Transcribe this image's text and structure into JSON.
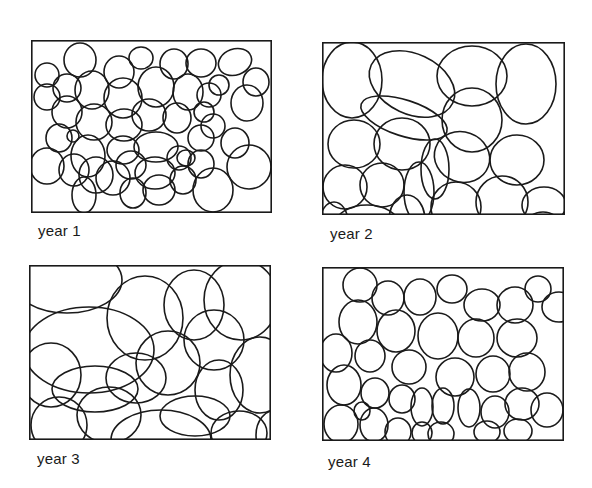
{
  "figure": {
    "stroke_color": "#1a1a1a",
    "background": "#ffffff",
    "panels": [
      {
        "label": "year 1",
        "box": {
          "x": 31,
          "y": 40,
          "w": 241,
          "h": 173
        },
        "label_pos": {
          "x": 38,
          "y": 222
        },
        "ellipses": [
          [
            16,
            35,
            12,
            12,
            0
          ],
          [
            49,
            20,
            16,
            17,
            0
          ],
          [
            88,
            32,
            15,
            16,
            0
          ],
          [
            110,
            18,
            12,
            11,
            0
          ],
          [
            143,
            24,
            14,
            15,
            0
          ],
          [
            170,
            23,
            15,
            14,
            0
          ],
          [
            204,
            22,
            17,
            13,
            -20
          ],
          [
            225,
            42,
            13,
            14,
            0
          ],
          [
            16,
            57,
            13,
            13,
            0
          ],
          [
            36,
            48,
            14,
            14,
            0
          ],
          [
            61,
            50,
            17,
            19,
            0
          ],
          [
            92,
            58,
            19,
            20,
            0
          ],
          [
            125,
            47,
            18,
            20,
            0
          ],
          [
            157,
            52,
            15,
            18,
            0
          ],
          [
            178,
            55,
            12,
            12,
            0
          ],
          [
            188,
            45,
            10,
            10,
            0
          ],
          [
            216,
            63,
            16,
            18,
            0
          ],
          [
            36,
            72,
            15,
            16,
            0
          ],
          [
            63,
            82,
            18,
            18,
            0
          ],
          [
            93,
            85,
            18,
            16,
            0
          ],
          [
            118,
            75,
            17,
            16,
            0
          ],
          [
            146,
            78,
            14,
            15,
            0
          ],
          [
            173,
            72,
            10,
            10,
            0
          ],
          [
            182,
            86,
            12,
            12,
            0
          ],
          [
            28,
            98,
            13,
            14,
            0
          ],
          [
            57,
            116,
            17,
            21,
            0
          ],
          [
            92,
            110,
            16,
            14,
            0
          ],
          [
            125,
            107,
            22,
            15,
            0
          ],
          [
            148,
            118,
            12,
            12,
            0
          ],
          [
            170,
            98,
            13,
            13,
            0
          ],
          [
            204,
            103,
            14,
            15,
            0
          ],
          [
            218,
            127,
            22,
            22,
            0
          ],
          [
            16,
            126,
            17,
            18,
            0
          ],
          [
            43,
            130,
            15,
            16,
            0
          ],
          [
            65,
            135,
            17,
            18,
            0
          ],
          [
            100,
            125,
            15,
            14,
            0
          ],
          [
            124,
            133,
            20,
            16,
            0
          ],
          [
            155,
            118,
            9,
            8,
            0
          ],
          [
            170,
            124,
            13,
            14,
            0
          ],
          [
            53,
            155,
            12,
            18,
            0
          ],
          [
            82,
            138,
            17,
            17,
            0
          ],
          [
            102,
            153,
            13,
            15,
            0
          ],
          [
            128,
            150,
            16,
            15,
            0
          ],
          [
            152,
            140,
            13,
            14,
            0
          ],
          [
            182,
            150,
            20,
            22,
            0
          ],
          [
            42,
            96,
            6,
            6,
            0
          ]
        ]
      },
      {
        "label": "year 2",
        "box": {
          "x": 322,
          "y": 42,
          "w": 243,
          "h": 173
        },
        "label_pos": {
          "x": 330,
          "y": 225
        },
        "ellipses": [
          [
            30,
            38,
            30,
            38,
            0
          ],
          [
            90,
            42,
            45,
            30,
            25
          ],
          [
            150,
            34,
            35,
            30,
            0
          ],
          [
            204,
            42,
            30,
            40,
            0
          ],
          [
            82,
            76,
            45,
            18,
            18
          ],
          [
            150,
            78,
            30,
            32,
            0
          ],
          [
            32,
            102,
            26,
            24,
            0
          ],
          [
            80,
            102,
            28,
            26,
            0
          ],
          [
            140,
            115,
            28,
            25,
            20
          ],
          [
            195,
            118,
            27,
            25,
            0
          ],
          [
            113,
            127,
            14,
            30,
            0
          ],
          [
            23,
            145,
            22,
            22,
            0
          ],
          [
            60,
            143,
            22,
            22,
            0
          ],
          [
            97,
            150,
            15,
            30,
            0
          ],
          [
            134,
            165,
            25,
            25,
            0
          ],
          [
            180,
            160,
            26,
            26,
            0
          ],
          [
            222,
            163,
            22,
            18,
            0
          ],
          [
            45,
            183,
            32,
            20,
            0
          ],
          [
            85,
            178,
            18,
            25,
            0
          ],
          [
            221,
            192,
            22,
            22,
            0
          ],
          [
            12,
            180,
            14,
            20,
            0
          ]
        ]
      },
      {
        "label": "year 3",
        "box": {
          "x": 29,
          "y": 265,
          "w": 242,
          "h": 175
        },
        "label_pos": {
          "x": 37,
          "y": 450
        },
        "ellipses": [
          [
            38,
            15,
            55,
            33,
            0
          ],
          [
            60,
            85,
            65,
            43,
            0
          ],
          [
            116,
            53,
            38,
            42,
            0
          ],
          [
            165,
            40,
            30,
            35,
            0
          ],
          [
            212,
            35,
            37,
            40,
            0
          ],
          [
            185,
            75,
            30,
            30,
            0
          ],
          [
            139,
            98,
            32,
            32,
            0
          ],
          [
            107,
            113,
            30,
            25,
            0
          ],
          [
            66,
            124,
            43,
            23,
            0
          ],
          [
            22,
            110,
            30,
            32,
            0
          ],
          [
            190,
            125,
            24,
            30,
            0
          ],
          [
            231,
            110,
            30,
            38,
            0
          ],
          [
            30,
            160,
            28,
            28,
            0
          ],
          [
            80,
            150,
            32,
            28,
            0
          ],
          [
            132,
            175,
            50,
            30,
            0
          ],
          [
            166,
            151,
            35,
            20,
            0
          ],
          [
            210,
            168,
            28,
            22,
            0
          ],
          [
            247,
            170,
            20,
            25,
            0
          ]
        ]
      },
      {
        "label": "year 4",
        "box": {
          "x": 322,
          "y": 267,
          "w": 242,
          "h": 174
        },
        "label_pos": {
          "x": 328,
          "y": 453
        },
        "ellipses": [
          [
            38,
            18,
            17,
            17,
            0
          ],
          [
            66,
            31,
            16,
            17,
            0
          ],
          [
            98,
            30,
            16,
            18,
            0
          ],
          [
            130,
            22,
            15,
            14,
            0
          ],
          [
            160,
            38,
            18,
            16,
            0
          ],
          [
            193,
            38,
            18,
            18,
            0
          ],
          [
            216,
            22,
            13,
            13,
            0
          ],
          [
            237,
            40,
            17,
            15,
            0
          ],
          [
            36,
            55,
            19,
            22,
            0
          ],
          [
            74,
            64,
            19,
            21,
            0
          ],
          [
            116,
            69,
            20,
            23,
            0
          ],
          [
            154,
            71,
            18,
            19,
            0
          ],
          [
            195,
            71,
            20,
            19,
            0
          ],
          [
            14,
            86,
            16,
            19,
            0
          ],
          [
            48,
            89,
            15,
            16,
            0
          ],
          [
            87,
            100,
            17,
            17,
            0
          ],
          [
            133,
            110,
            19,
            19,
            0
          ],
          [
            171,
            107,
            17,
            18,
            0
          ],
          [
            205,
            105,
            18,
            19,
            0
          ],
          [
            22,
            118,
            17,
            20,
            0
          ],
          [
            53,
            126,
            14,
            15,
            0
          ],
          [
            80,
            132,
            13,
            14,
            0
          ],
          [
            100,
            140,
            11,
            19,
            0
          ],
          [
            121,
            139,
            11,
            18,
            0
          ],
          [
            147,
            141,
            11,
            19,
            0
          ],
          [
            173,
            145,
            14,
            16,
            0
          ],
          [
            200,
            137,
            17,
            16,
            0
          ],
          [
            225,
            143,
            16,
            17,
            0
          ],
          [
            19,
            157,
            17,
            19,
            0
          ],
          [
            52,
            158,
            14,
            17,
            0
          ],
          [
            76,
            165,
            13,
            14,
            0
          ],
          [
            100,
            166,
            10,
            11,
            0
          ],
          [
            119,
            167,
            13,
            12,
            0
          ],
          [
            165,
            165,
            13,
            11,
            0
          ],
          [
            196,
            164,
            14,
            12,
            0
          ],
          [
            40,
            144,
            8,
            9,
            0
          ]
        ]
      }
    ]
  }
}
